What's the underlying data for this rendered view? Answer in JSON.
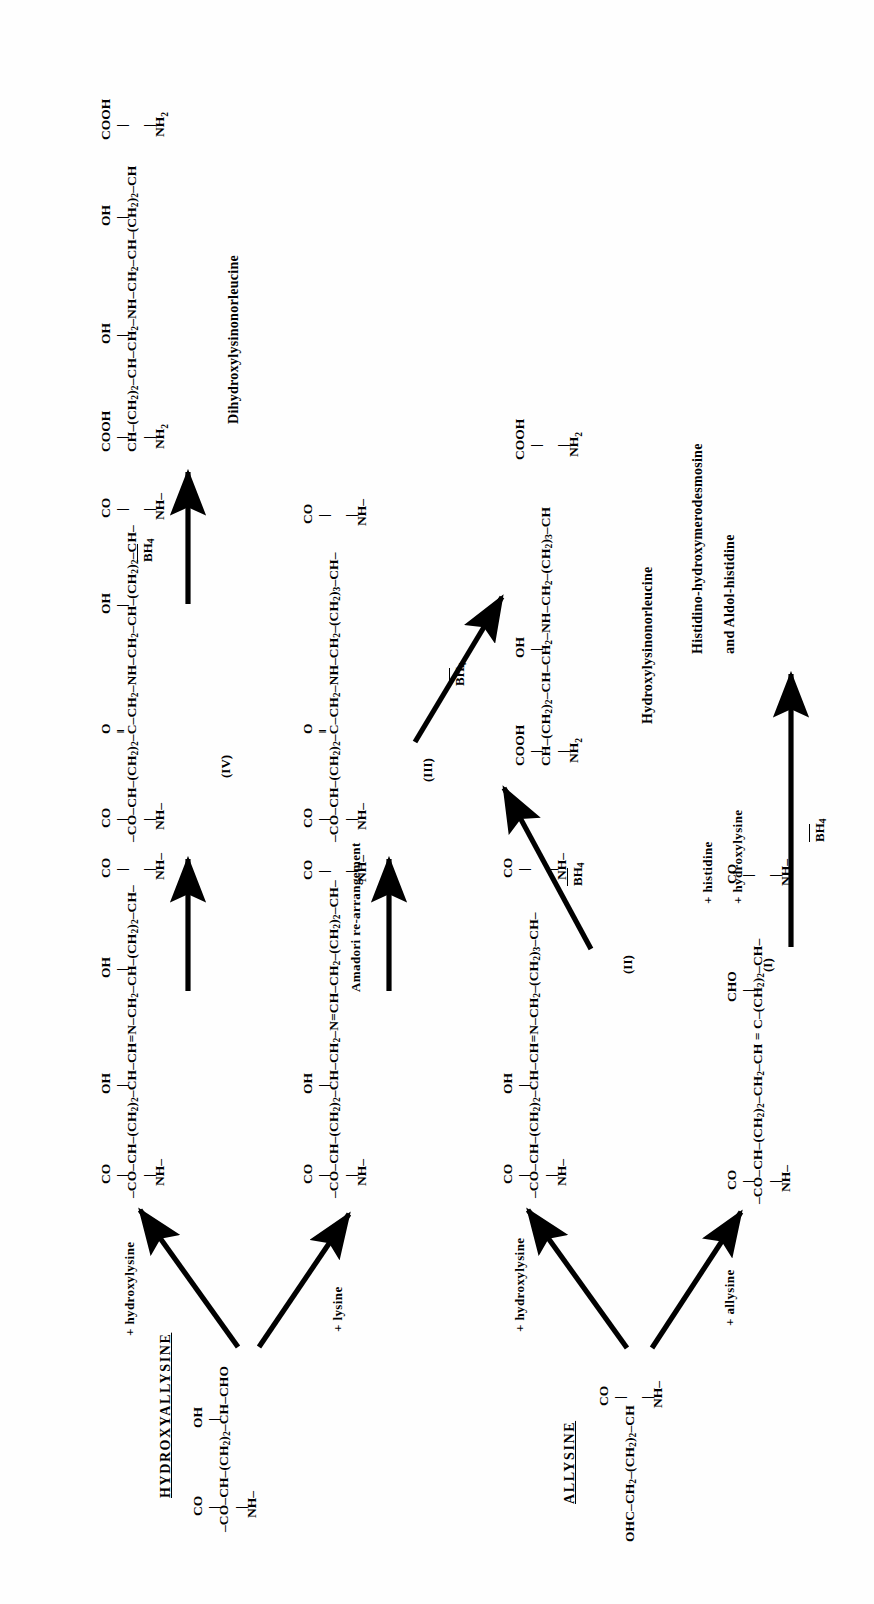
{
  "diagram": {
    "pathways": [
      {
        "name": "ALLYSINE",
        "label": "ALLYSINE",
        "precursor_formula": "OHC—CH2—(CH2)2—CH",
        "precursor_top": "CO",
        "precursor_bottom": "NH"
      },
      {
        "name": "HYDROXYALLYSINE",
        "label": "HYDROXYALLYSINE",
        "precursor_formula": "—CO—CH—(CH2)2—CH—CHO",
        "precursor_top": "OH",
        "precursor_bottom": "NH"
      }
    ],
    "conditions": {
      "plus_allysine": "+ allysine",
      "plus_hydroxylysine": "+ hydroxylysine",
      "plus_lysine": "+ lysine",
      "plus_histidine": "+ histidine",
      "amadori": "Amadori re-arrangement",
      "bh4": "BH",
      "bh4_sub": "4"
    },
    "romans": {
      "i": "(I)",
      "ii": "(II)",
      "iii": "(III)",
      "iv": "(IV)"
    },
    "products": {
      "histidino": "Histidino-hydroxymerodesmosine",
      "aldol": "and Aldol-histidine",
      "hln": "Hydroxylysinonorleucine",
      "dhln": "Dihydroxylysinonorleucine"
    },
    "structures": {
      "allysine": {
        "name": "allysine",
        "top": "CO",
        "main": "OHC—CH2—(CH2)2—CH",
        "bottom": "NH"
      },
      "hydroxyallysine": {
        "name": "hydroxyallysine",
        "top_left": "CO",
        "top_right": "OH",
        "main": "—CO—CH—(CH2)2—CH—CHO",
        "bottom": "NH"
      },
      "compound_I": {
        "name": "aldol condensation product",
        "roman": "(I)",
        "left_top": "CO",
        "left_bottom": "NH",
        "branch": "CHO",
        "main": "—CO—CH—(CH2)2—CH2—CH = C—(CH2)2—CH—NH—",
        "right_top": "CO",
        "right_bottom": "NH"
      },
      "compound_II": {
        "name": "schiff base allysine + hydroxylysine",
        "roman": "(II)",
        "branch": "OH",
        "main": "—CO—CH—(CH2)2—CH—CH=N—CH2—(CH2)3—CH—NH—",
        "left_top": "CO",
        "left_bottom": "NH",
        "right_top": "CO",
        "right_bottom": "NH"
      },
      "compound_III": {
        "name": "amadori product keto-amine",
        "roman": "(III)",
        "branch": "O",
        "main": "—CO—CH—(CH2)2—C—CH2—NH—CH2—(CH2)3—CH—NH—",
        "left_top": "CO",
        "left_bottom": "NH",
        "right_top": "CO",
        "right_bottom": "NH"
      },
      "compound_IV": {
        "name": "amadori product keto-amine hydroxylated",
        "roman": "(IV)",
        "branch_left": "O",
        "branch_right": "OH",
        "main": "—CO—CH—(CH2)2—C—CH2—NH—CH2—CH—(CH2)2—CH—NH—",
        "left_top": "CO",
        "left_bottom": "NH",
        "right_top": "CO",
        "right_bottom": "NH"
      },
      "schiff_lysine": {
        "name": "schiff base hydroxyallysine + lysine",
        "branch": "OH",
        "main": "—CO—CH—(CH2)2—CH—CH2—N=CH—CH2—(CH2)2—CH—NH—",
        "left_top": "CO",
        "left_bottom": "NH",
        "right_top": "CO",
        "right_bottom": "NH"
      },
      "schiff_hydroxylysine": {
        "name": "schiff base hydroxyallysine + hydroxylysine",
        "branch_left": "OH",
        "branch_right": "OH",
        "main": "—CO—CH—(CH2)2—CH—CH=N—CH2—CH—(CH2)2—CH—NH—",
        "left_top": "CO",
        "left_bottom": "NH",
        "right_top": "CO",
        "right_bottom": "NH"
      },
      "hydroxylysinonorleucine": {
        "name": "hydroxylysinonorleucine",
        "branch": "OH",
        "main": "CH—(CH2)2—CH—CH2—NH—CH2—(CH2)3—CH",
        "left_top": "COOH",
        "left_bottom": "NH2",
        "right_top": "COOH",
        "right_bottom": "NH2"
      },
      "dihydroxylysinonorleucine": {
        "name": "dihydroxylysinonorleucine",
        "branch_left": "OH",
        "branch_right": "OH",
        "main": "CH—(CH2)2—CH—CH2—NH—CH2—CH—(CH2)2—CH",
        "left_top": "COOH",
        "left_bottom": "NH2",
        "right_top": "COOH",
        "right_bottom": "NH2"
      }
    }
  }
}
